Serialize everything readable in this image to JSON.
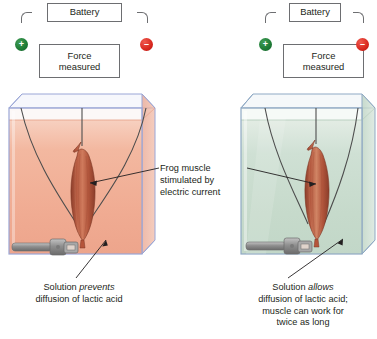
{
  "diagram": {
    "panels": [
      {
        "id": "left",
        "battery_label": "Battery",
        "force_label_line1": "Force",
        "force_label_line2": "measured",
        "positive_terminal": "+",
        "negative_terminal": "–",
        "solution_color": "#f2b49c",
        "solution_name": "lactic-acid-blocking solution",
        "caption_line1_pre": "Solution ",
        "caption_line1_em": "prevents",
        "caption_line2": "diffusion of lactic acid"
      },
      {
        "id": "right",
        "battery_label": "Battery",
        "force_label_line1": "Force",
        "force_label_line2": "measured",
        "positive_terminal": "+",
        "negative_terminal": "–",
        "solution_color": "#cfe0d4",
        "solution_name": "lactic-acid-permitting solution",
        "caption_line1_pre": "Solution ",
        "caption_line1_em": "allows",
        "caption_line2": "diffusion of lactic acid;",
        "caption_line3": "muscle can work for",
        "caption_line4": "twice as long"
      }
    ],
    "center_label": {
      "line1": "Frog muscle",
      "line2": "stimulated by",
      "line3": "electric current"
    },
    "colors": {
      "wire": "#6d6e71",
      "box_border": "#6d6e71",
      "text": "#231f20",
      "tank_glass_left": "#9aa6d6",
      "tank_glass_right": "#8fa9c4",
      "muscle": "#b5543a",
      "clamp": "#8c8c8c",
      "positive": "#1c7a34",
      "negative": "#d8261d"
    }
  }
}
